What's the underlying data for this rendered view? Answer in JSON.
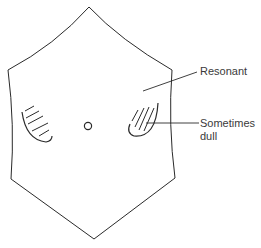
{
  "diagram": {
    "type": "anatomical-percussion-diagram",
    "labels": {
      "resonant": "Resonant",
      "sometimes_dull_line1": "Sometimes",
      "sometimes_dull_line2": "dull"
    },
    "colors": {
      "stroke": "#2a2a2a",
      "text": "#3a3a3a",
      "background": "#ffffff"
    }
  }
}
